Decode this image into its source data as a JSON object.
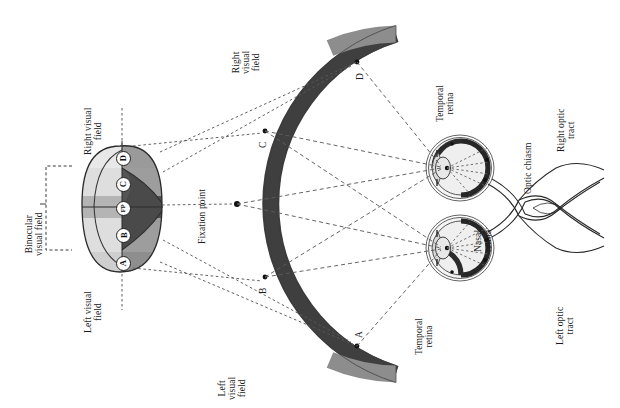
{
  "figure": {
    "type": "anatomical-diagram",
    "orientation": "rotated-90-ccw"
  },
  "labels": {
    "right_visual_field_oval": "Right visual\nfield",
    "left_visual_field_oval": "Left visual\nfield",
    "binocular_visual_field": "Binocular\nvisual field",
    "right_visual_field_arc": "Right\nvisual\nfield",
    "left_visual_field_arc": "Left\nvisual\nfield",
    "fixation_point": "Fixation point",
    "temporal_retina_top": "Temporal\nretina",
    "temporal_retina_bottom": "Temporal\nretina",
    "nasal_retina": "Nasal\nretina",
    "optic_chiasm": "Optic chiasm",
    "right_optic_tract": "Right optic\ntract",
    "left_optic_tract": "Left optic\ntract"
  },
  "field_points": [
    {
      "id": "A",
      "label": "A"
    },
    {
      "id": "B",
      "label": "B"
    },
    {
      "id": "FP",
      "label": "FP"
    },
    {
      "id": "C",
      "label": "C"
    },
    {
      "id": "D",
      "label": "D"
    }
  ],
  "arc_points": [
    {
      "id": "A",
      "label": "A"
    },
    {
      "id": "B",
      "label": "B"
    },
    {
      "id": "C",
      "label": "C"
    },
    {
      "id": "D",
      "label": "D"
    }
  ],
  "colors": {
    "page_background": "#ffffff",
    "ink": "#1b1b1b",
    "arc_dark": "#3f3f3f",
    "arc_light": "#8f8f8f",
    "field_lightest": "#e3e3e3",
    "field_light": "#d2d2d2",
    "field_mid": "#a9a9a9",
    "field_dark": "#6e6e6e",
    "field_darkest": "#4a4a4a",
    "eye_fill": "#efefef",
    "retina_band": "#2a2a2a",
    "projection_line": "#5a5a5a"
  }
}
